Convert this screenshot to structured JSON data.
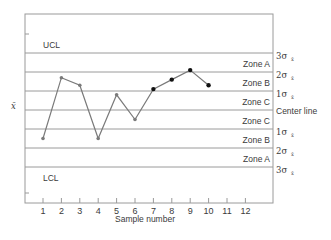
{
  "chart_data": {
    "type": "line",
    "title": "",
    "xlabel": "Sample number",
    "ylabel": "x̄",
    "x": [
      1,
      2,
      3,
      4,
      5,
      6,
      7,
      8,
      9,
      10
    ],
    "xticks": [
      "1",
      "2",
      "3",
      "4",
      "5",
      "6",
      "7",
      "8",
      "9",
      "10",
      "11",
      "12"
    ],
    "series": [
      {
        "name": "Sample means (in sigma units from center line)",
        "values": [
          -1.5,
          1.7,
          1.3,
          -1.5,
          0.8,
          -0.5,
          1.1,
          1.6,
          2.1,
          1.3
        ],
        "highlighted_from_index": 6
      }
    ],
    "ylim": [
      -5,
      5
    ],
    "grid": false,
    "reference_lines": [
      {
        "value": 3,
        "left_label": "UCL",
        "right_label": "3σ",
        "zone_label": "Zone A"
      },
      {
        "value": 2,
        "right_label": "2σ",
        "zone_label": "Zone B"
      },
      {
        "value": 1,
        "right_label": "1σ",
        "zone_label": "Zone C"
      },
      {
        "value": 0,
        "right_label": "Center line",
        "zone_label": "Zone C"
      },
      {
        "value": -1,
        "right_label": "1σ",
        "zone_label": "Zone B"
      },
      {
        "value": -2,
        "right_label": "2σ",
        "zone_label": "Zone A"
      },
      {
        "value": -3,
        "left_label": "LCL",
        "right_label": "3σ"
      }
    ],
    "zones_upper": [
      "Zone A",
      "Zone B",
      "Zone C"
    ],
    "zones_lower": [
      "Zone C",
      "Zone B",
      "Zone A"
    ]
  },
  "labels": {
    "ucl": "UCL",
    "lcl": "LCL",
    "center": "Center line",
    "ylabel": "x̄",
    "xlabel": "Sample number",
    "sigma": "σ",
    "sigma_sub": "x̄",
    "sig3": "3",
    "sig2": "2",
    "sig1": "1",
    "zoneA": "Zone A",
    "zoneB": "Zone B",
    "zoneC": "Zone C"
  },
  "colors": {
    "line": "#7a7a7a",
    "frame": "#9a9a9a",
    "point_normal": "#7a7a7a",
    "point_highlight": "#111111"
  }
}
